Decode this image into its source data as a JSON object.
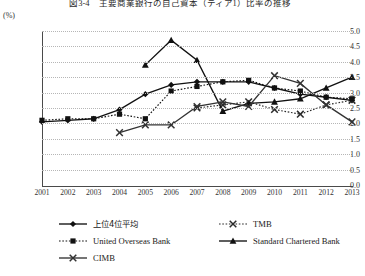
{
  "chart_data": {
    "type": "line",
    "title": "図3-4　主要商業銀行の自己資本（ティア1）比率の推移",
    "unit_label": "(%)",
    "xlabel": "",
    "ylabel": "",
    "ylim": [
      0.0,
      5.0
    ],
    "ytick_step": 0.5,
    "yticks": [
      "5.0",
      "4.5",
      "4.0",
      "3.5",
      "3.0",
      "2.5",
      "2.0",
      "1.5",
      "1.0",
      "0.5",
      "0.0"
    ],
    "grid": true,
    "legend_position": "below",
    "categories": [
      2001,
      2002,
      2003,
      2004,
      2005,
      2006,
      2007,
      2008,
      2009,
      2010,
      2011,
      2012,
      2013
    ],
    "xtick_labels": [
      "2001",
      "2002",
      "2003",
      "2004",
      "2005",
      "2006",
      "2007",
      "2008",
      "2009",
      "2010",
      "2011",
      "2012",
      "2013"
    ],
    "series": [
      {
        "name": "上位4位平均",
        "marker": "diamond",
        "line": "solid",
        "color": "#111111",
        "values": [
          2.05,
          2.1,
          2.15,
          2.45,
          2.95,
          3.25,
          3.35,
          3.35,
          3.35,
          3.15,
          2.95,
          2.85,
          2.75
        ]
      },
      {
        "name": "TMB",
        "marker": "x",
        "line": "dotted",
        "color": "#2a2a2a",
        "values": [
          null,
          null,
          null,
          null,
          null,
          null,
          2.5,
          2.6,
          2.7,
          2.45,
          2.3,
          2.6,
          2.75
        ]
      },
      {
        "name": "United Overseas Bank",
        "marker": "square",
        "line": "dotted",
        "color": "#111111",
        "values": [
          2.1,
          2.15,
          2.15,
          2.3,
          2.15,
          3.05,
          3.2,
          3.35,
          3.4,
          3.15,
          3.05,
          2.85,
          2.8
        ]
      },
      {
        "name": "Standard Chartered Bank",
        "marker": "triangle",
        "line": "solid",
        "color": "#111111",
        "values": [
          null,
          null,
          null,
          null,
          3.9,
          4.7,
          4.05,
          2.4,
          2.65,
          2.7,
          2.8,
          3.15,
          3.5
        ]
      },
      {
        "name": "CIMB",
        "marker": "x",
        "line": "solid",
        "color": "#333333",
        "values": [
          null,
          null,
          null,
          1.7,
          1.95,
          1.95,
          2.55,
          2.7,
          2.55,
          3.55,
          3.3,
          2.6,
          2.05
        ]
      }
    ]
  },
  "legend": {
    "items": [
      {
        "label": "上位4位平均",
        "is_jp": true
      },
      {
        "label": "TMB",
        "is_jp": false
      },
      {
        "label": "United Overseas Bank",
        "is_jp": false
      },
      {
        "label": "Standard Chartered Bank",
        "is_jp": false
      },
      {
        "label": "CIMB",
        "is_jp": false
      }
    ]
  }
}
